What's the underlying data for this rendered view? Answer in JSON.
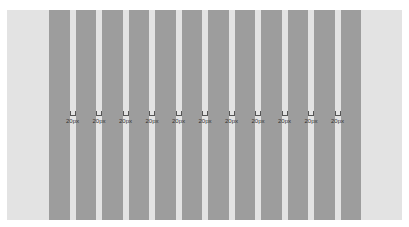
{
  "diagram": {
    "type": "column-grid",
    "column_count": 12,
    "gutter_count": 11,
    "gutter_label": "20px",
    "gutters": [
      {
        "label": "20px"
      },
      {
        "label": "20px"
      },
      {
        "label": "20px"
      },
      {
        "label": "20px"
      },
      {
        "label": "20px"
      },
      {
        "label": "20px"
      },
      {
        "label": "20px"
      },
      {
        "label": "20px"
      },
      {
        "label": "20px"
      },
      {
        "label": "20px"
      },
      {
        "label": "20px"
      }
    ],
    "colors": {
      "background": "#ffffff",
      "panel": "#e3e3e3",
      "column": "#9d9d9d",
      "marker": "#555555"
    }
  }
}
